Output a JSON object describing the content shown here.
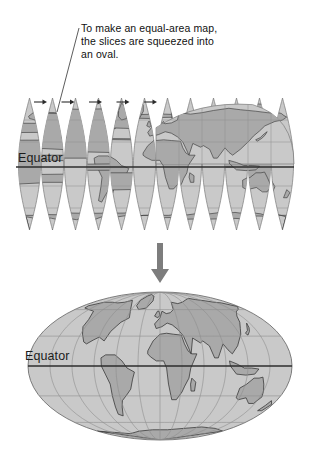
{
  "figure": {
    "caption_lines": [
      "To make an equal-area map,",
      "the slices are squeezed into",
      "an oval."
    ],
    "leader_line_name": "caption-leader-line"
  },
  "gore_map": {
    "equator_label": "Equator",
    "gore_count": 12,
    "squeeze_arrow_count": 5,
    "description": "interrupted globe gores"
  },
  "oval_map": {
    "equator_label": "Equator",
    "description": "equal-area oval projection"
  },
  "transition": {
    "arrow_label": "down-arrow"
  },
  "colors": {
    "background": "#ffffff",
    "ocean": "#c9c9c9",
    "land": "#a9a9a9",
    "land_outline": "#3a3a3a",
    "graticule": "#8e8e8e",
    "equator_line": "#2d2d2d",
    "arrow": "#7d7d7d",
    "text": "#111111"
  }
}
